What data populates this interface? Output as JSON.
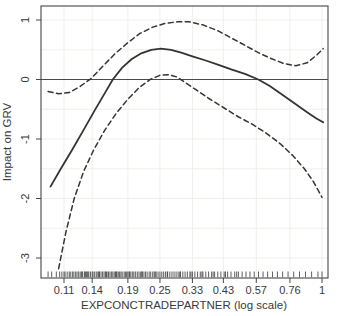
{
  "chart_data": {
    "type": "line",
    "title": "",
    "xlabel": "EXPCONCTRADEPARTNER (log scale)",
    "ylabel": "Impact on GRV",
    "x_scale": "log",
    "xlim": [
      0.0905,
      1.053
    ],
    "ylim": [
      -3.32,
      1.24
    ],
    "x_ticks": [
      0.11,
      0.14,
      0.19,
      0.25,
      0.33,
      0.43,
      0.57,
      0.76,
      1
    ],
    "x_tick_labels": [
      "0.11",
      "0.14",
      "0.19",
      "0.25",
      "0.33",
      "0.43",
      "0.57",
      "0.76",
      "1"
    ],
    "y_ticks": [
      1,
      0,
      -1,
      -2,
      -3
    ],
    "y_tick_labels": [
      "1",
      "0",
      "-1",
      "-2",
      "-3"
    ],
    "zero_line_y": 0,
    "grid": "faint",
    "legend": "none",
    "series": [
      {
        "name": "smooth-estimate",
        "style": "solid",
        "points": [
          [
            0.098,
            -1.8
          ],
          [
            0.107,
            -1.5
          ],
          [
            0.118,
            -1.18
          ],
          [
            0.13,
            -0.85
          ],
          [
            0.143,
            -0.52
          ],
          [
            0.155,
            -0.25
          ],
          [
            0.167,
            0.0
          ],
          [
            0.181,
            0.2
          ],
          [
            0.196,
            0.34
          ],
          [
            0.213,
            0.44
          ],
          [
            0.232,
            0.5
          ],
          [
            0.252,
            0.52
          ],
          [
            0.275,
            0.5
          ],
          [
            0.3,
            0.45
          ],
          [
            0.33,
            0.39
          ],
          [
            0.37,
            0.32
          ],
          [
            0.41,
            0.25
          ],
          [
            0.46,
            0.17
          ],
          [
            0.52,
            0.09
          ],
          [
            0.58,
            0.0
          ],
          [
            0.64,
            -0.11
          ],
          [
            0.71,
            -0.25
          ],
          [
            0.79,
            -0.4
          ],
          [
            0.88,
            -0.55
          ],
          [
            0.95,
            -0.65
          ],
          [
            1.01,
            -0.72
          ]
        ]
      },
      {
        "name": "upper-confidence-band",
        "style": "dashed",
        "points": [
          [
            0.096,
            -0.2
          ],
          [
            0.105,
            -0.24
          ],
          [
            0.115,
            -0.22
          ],
          [
            0.126,
            -0.12
          ],
          [
            0.139,
            0.02
          ],
          [
            0.153,
            0.22
          ],
          [
            0.17,
            0.43
          ],
          [
            0.19,
            0.62
          ],
          [
            0.21,
            0.77
          ],
          [
            0.235,
            0.88
          ],
          [
            0.26,
            0.94
          ],
          [
            0.29,
            0.97
          ],
          [
            0.32,
            0.97
          ],
          [
            0.36,
            0.92
          ],
          [
            0.41,
            0.82
          ],
          [
            0.46,
            0.7
          ],
          [
            0.52,
            0.57
          ],
          [
            0.58,
            0.45
          ],
          [
            0.65,
            0.35
          ],
          [
            0.72,
            0.27
          ],
          [
            0.8,
            0.23
          ],
          [
            0.88,
            0.28
          ],
          [
            0.95,
            0.4
          ],
          [
            1.01,
            0.52
          ]
        ]
      },
      {
        "name": "lower-confidence-band",
        "style": "dashed",
        "points": [
          [
            0.105,
            -3.18
          ],
          [
            0.112,
            -2.55
          ],
          [
            0.12,
            -2.0
          ],
          [
            0.13,
            -1.55
          ],
          [
            0.142,
            -1.18
          ],
          [
            0.156,
            -0.85
          ],
          [
            0.172,
            -0.57
          ],
          [
            0.19,
            -0.33
          ],
          [
            0.21,
            -0.13
          ],
          [
            0.23,
            0.0
          ],
          [
            0.25,
            0.07
          ],
          [
            0.27,
            0.08
          ],
          [
            0.29,
            0.04
          ],
          [
            0.31,
            -0.05
          ],
          [
            0.34,
            -0.17
          ],
          [
            0.38,
            -0.32
          ],
          [
            0.43,
            -0.47
          ],
          [
            0.49,
            -0.63
          ],
          [
            0.55,
            -0.75
          ],
          [
            0.62,
            -0.9
          ],
          [
            0.7,
            -1.08
          ],
          [
            0.78,
            -1.28
          ],
          [
            0.86,
            -1.5
          ],
          [
            0.93,
            -1.72
          ],
          [
            1.0,
            -1.98
          ]
        ]
      }
    ],
    "rug_x": [
      0.096,
      0.099,
      0.103,
      0.106,
      0.108,
      0.11,
      0.111,
      0.113,
      0.115,
      0.116,
      0.118,
      0.119,
      0.121,
      0.122,
      0.124,
      0.125,
      0.127,
      0.128,
      0.129,
      0.131,
      0.132,
      0.134,
      0.135,
      0.136,
      0.138,
      0.14,
      0.141,
      0.143,
      0.145,
      0.147,
      0.149,
      0.151,
      0.153,
      0.155,
      0.157,
      0.159,
      0.161,
      0.163,
      0.165,
      0.167,
      0.169,
      0.171,
      0.173,
      0.175,
      0.177,
      0.179,
      0.181,
      0.184,
      0.186,
      0.188,
      0.19,
      0.193,
      0.195,
      0.198,
      0.2,
      0.203,
      0.206,
      0.209,
      0.212,
      0.215,
      0.218,
      0.221,
      0.224,
      0.228,
      0.231,
      0.235,
      0.238,
      0.242,
      0.246,
      0.25,
      0.254,
      0.258,
      0.262,
      0.267,
      0.272,
      0.277,
      0.282,
      0.287,
      0.292,
      0.298,
      0.304,
      0.31,
      0.316,
      0.323,
      0.33,
      0.337,
      0.345,
      0.353,
      0.361,
      0.37,
      0.379,
      0.389,
      0.399,
      0.41,
      0.421,
      0.433,
      0.446,
      0.459,
      0.474,
      0.489,
      0.505,
      0.522,
      0.54,
      0.56,
      0.581,
      0.604,
      0.628,
      0.655,
      0.683,
      0.714,
      0.748,
      0.785,
      0.825,
      0.868,
      0.915,
      0.966,
      1.0,
      0.133,
      0.148,
      0.158,
      0.172,
      0.192,
      0.214,
      0.24,
      0.266,
      0.296,
      0.326,
      0.358,
      0.394,
      0.438,
      0.482
    ],
    "colors": {
      "curve": "#343434",
      "zero_line": "#4a4a4a",
      "axis": "#454545",
      "grid": "#efefeb",
      "text": "#3a3a3a",
      "rug": "#2c2c2c",
      "background": "#ffffff"
    }
  }
}
